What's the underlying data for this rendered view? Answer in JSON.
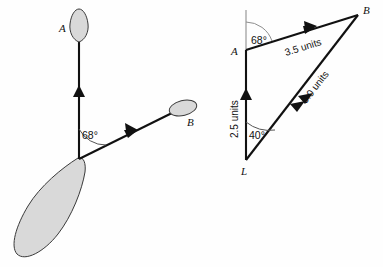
{
  "figure": {
    "background_color": "#fefefe",
    "ink_color": "#111111",
    "fill_color": "#d9d9d9"
  },
  "left_diagram": {
    "name": "plant-sketch",
    "description": "Sketch of a plant with a main shoot toward A and a side shoot toward B, with a large leaf at the base",
    "labels": {
      "shoot_a": "A",
      "shoot_b": "B",
      "angle": "68°"
    },
    "vectors": [
      {
        "name": "vector-to-a",
        "label": "A",
        "direction": "up"
      },
      {
        "name": "vector-to-b",
        "label": "B",
        "direction": "up-right"
      }
    ],
    "angle_value": "68°"
  },
  "right_diagram": {
    "name": "vector-triangle",
    "description": "Vector triangle L-A-B with vertical reference line at A",
    "vertices": {
      "a": "A",
      "b": "B",
      "l": "L"
    },
    "edges": [
      {
        "name": "edge-l-a",
        "from": "L",
        "to": "A",
        "magnitude": "2.5 units"
      },
      {
        "name": "edge-a-b",
        "from": "A",
        "to": "B",
        "magnitude": "3.5 units"
      },
      {
        "name": "edge-l-b",
        "from": "L",
        "to": "B",
        "magnitude": "5.0 units"
      }
    ],
    "angles": [
      {
        "name": "angle-at-a",
        "vertex": "A",
        "value": "68°"
      },
      {
        "name": "angle-at-l",
        "vertex": "L",
        "value": "40°"
      }
    ],
    "magnitudes": {
      "la": "2.5 units",
      "ab": "3.5 units",
      "lb": "5.0 units"
    },
    "angle_a": "68°",
    "angle_l": "40°"
  }
}
